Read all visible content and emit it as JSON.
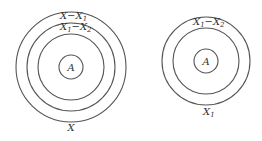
{
  "diagrams": [
    {
      "id": "left",
      "center": [
        71,
        67
      ],
      "rings": [
        {
          "r": 55,
          "label": "X−X",
          "label_sub": "1"
        },
        {
          "r": 44,
          "label": "X",
          "label_sub": "1",
          "label_mid": "−X",
          "label_sub2": "2"
        },
        {
          "r": 33
        },
        {
          "r": 12,
          "center_label": "A"
        }
      ],
      "bottom_label": "X"
    },
    {
      "id": "right",
      "center": [
        206,
        61
      ],
      "rings": [
        {
          "r": 44,
          "label": "X",
          "label_sub": "1",
          "label_mid": "−X",
          "label_sub2": "2"
        },
        {
          "r": 33
        },
        {
          "r": 12,
          "center_label": "A"
        }
      ],
      "bottom_label": "X",
      "bottom_label_sub": "1"
    }
  ],
  "colors": {
    "stroke": "#555555",
    "text": "#333333",
    "background": "#ffffff"
  }
}
